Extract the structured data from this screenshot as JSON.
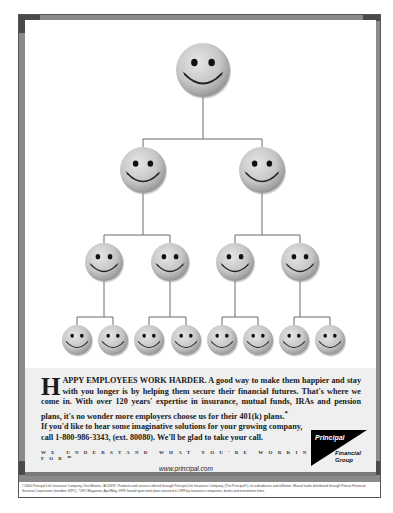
{
  "ad": {
    "theme": "org-chart-of-smiley-faces",
    "colors": {
      "frame": "#8a8a8a",
      "frame_dark": "#4a4a4a",
      "copy_background": "#efefef",
      "smiley_face": "#c8c8c8",
      "connector_line": "#6a6a6a",
      "logo_black": "#000000"
    },
    "org_chart": {
      "levels": [
        {
          "level": 1,
          "count": 1,
          "y": 70,
          "radius": 27,
          "x": [
            203
          ]
        },
        {
          "level": 2,
          "count": 2,
          "y": 170,
          "radius": 23,
          "x": [
            143,
            262
          ]
        },
        {
          "level": 3,
          "count": 4,
          "y": 262,
          "radius": 19,
          "x": [
            104,
            170,
            235,
            300
          ]
        },
        {
          "level": 4,
          "count": 8,
          "y": 340,
          "radius": 15,
          "x": [
            77,
            113,
            149,
            186,
            222,
            258,
            294,
            330
          ]
        }
      ]
    },
    "copy": {
      "drop_cap": "H",
      "headline": "APPY EMPLOYEES WORK HARDER.",
      "line1_rest": " A good way to make them happier and stay with you longer is by helping them secure their financial futures. That's where we come in. With over 120 years' expertise in insurance, mutual funds, IRAs and pension plans, it's no wonder more employers choose us for their 401(k) plans.",
      "footnote_mark": "*",
      "line2": "If you'd like to hear some imaginative solutions for your growing company, call 1-800-986-3343, (ext. 80080). We'll be glad to take your call.",
      "tagline": "WE UNDERSTAND WHAT YOU'RE WORKING FOR℠",
      "url": "www.principal.com"
    },
    "logo": {
      "name": "Principal",
      "sub_line1": "Financial",
      "sub_line2": "Group"
    },
    "legal": "©2000 Principal Life Insurance Company, Des Moines, IA 50392. Products and services offered through Principal Life Insurance Company (The Principal®), its subsidiaries and affiliates. Mutual funds distributed through Princor Financial Services Corporation (member SIPC). *CFO Magazine, April/May 1999, based upon total plans serviced in 1999 by insurance companies, banks and investment firms."
  }
}
